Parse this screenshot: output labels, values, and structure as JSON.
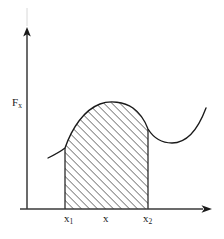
{
  "figure": {
    "background_color": "#ffffff",
    "stroke_color": "#1a1a1a",
    "hatch_color": "#303030",
    "axes": {
      "y_axis_label": "F",
      "y_axis_label_sub": "x",
      "x_axis_label": "",
      "y_axis_x_px": 27,
      "x_axis_y_px": 209,
      "y_axis_top_px": 29,
      "x_axis_right_px": 212
    },
    "x_ticks": [
      {
        "name": "x1",
        "label": "x",
        "sub": "1",
        "x_px": 65
      },
      {
        "name": "x",
        "label": "x",
        "sub": "",
        "x_px": 107
      },
      {
        "name": "x2",
        "label": "x",
        "sub": "2",
        "x_px": 148
      }
    ],
    "region": {
      "name": "work-area",
      "fill": "diagonal-hatch",
      "hatch_angle_deg": 45,
      "hatch_spacing_px": 4,
      "left_px": 65,
      "right_px": 148,
      "baseline_px": 209
    },
    "curve": {
      "name": "force-curve",
      "start_px": [
        48,
        158
      ],
      "peak_px": [
        115,
        103
      ],
      "valley_px": [
        172,
        128
      ],
      "end_px": [
        206,
        108
      ]
    }
  }
}
